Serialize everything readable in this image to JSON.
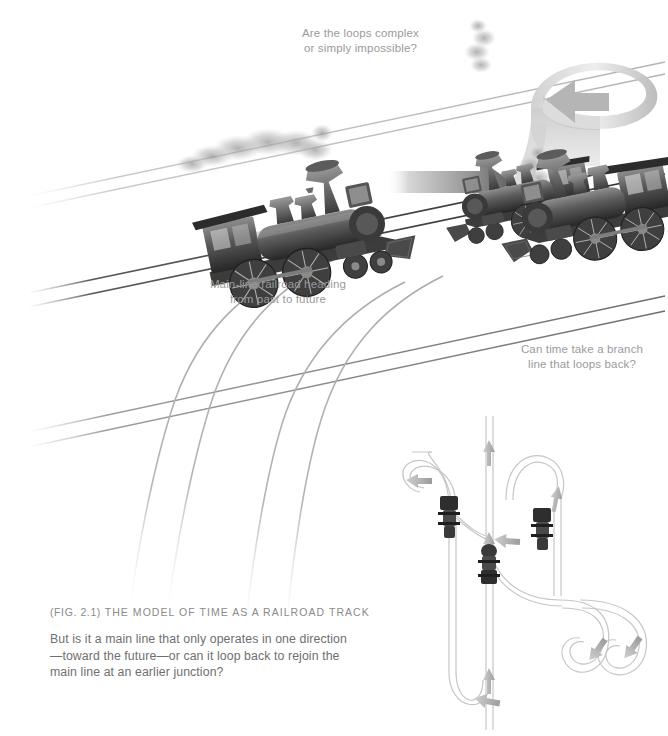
{
  "figure": {
    "title_prefix": "(Fig. 2.1)",
    "title": "The Model of Time as a Railroad Track",
    "body": "But is it a main line that only operates in one direction\n—toward the future—or can it loop back to rejoin the\nmain line at an earlier junction?"
  },
  "annotations": {
    "loops": "Are the loops complex\nor simply impossible?",
    "mainline": "Main-line railroad heading\nfrom past to future",
    "branch": "Can time take a branch\nline that loops back?"
  },
  "colors": {
    "background": "#ffffff",
    "text_body": "#6f6f6f",
    "text_annotation": "#9a9a9a",
    "text_caption_title": "#8a8a8a",
    "rail_dark": "#3a3a3a",
    "rail_light": "#b9b9b9",
    "branch_rail": "#b0b0b0",
    "arrow_dark": "#6d6d6d",
    "arrow_light": "#d8d8d8",
    "loco_dark": "#2b2b2b",
    "loco_mid": "#6a6a6a",
    "loco_light": "#a8a8a8",
    "smoke": "#9d9d9d",
    "schematic_track": "#c9c9c9",
    "schematic_arrow": "#a6a6a6"
  },
  "scene": {
    "locomotives": [
      {
        "name": "main-line-locomotive",
        "direction": "right",
        "position": "center-left"
      },
      {
        "name": "looping-locomotive",
        "direction": "left",
        "position": "top-right"
      },
      {
        "name": "branch-line-locomotive",
        "direction": "left",
        "position": "mid-right"
      }
    ],
    "arrows": [
      {
        "name": "forward-time-arrow",
        "shape": "straight",
        "points": "right"
      },
      {
        "name": "loop-time-arrow",
        "shape": "ribbon-loop",
        "points": "left"
      }
    ],
    "rails": {
      "main_pairs": 3,
      "branch_curves": 4
    }
  },
  "schematic": {
    "name": "track-switching-diagram",
    "main_line": "vertical",
    "flow": "upward",
    "switch_count": 3,
    "return_loops": 3
  }
}
